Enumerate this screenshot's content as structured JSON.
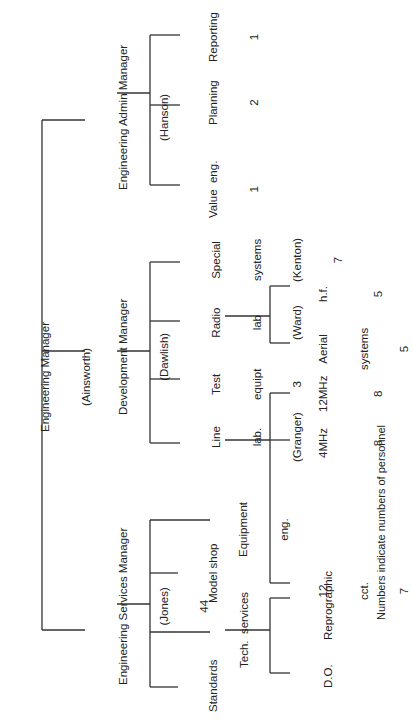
{
  "root": {
    "title": "Engineering Manager",
    "person": "(Ainsworth)"
  },
  "admin": {
    "title": "Engineering Admin Manager",
    "person": "(Hanson)",
    "children": [
      {
        "name": "Value  eng.",
        "count": "1"
      },
      {
        "name": "Planning",
        "count": "2"
      },
      {
        "name": "Reporting",
        "count": "1"
      }
    ]
  },
  "development": {
    "title": "Development Manager",
    "person": "(Dawlish)",
    "line_lab": {
      "l1": "Line",
      "l2": "lab.",
      "l3": "(Granger)",
      "children": [
        {
          "l1": "12",
          "l2": "cct.",
          "count": "7"
        },
        {
          "name": "4MHz",
          "count": "8"
        },
        {
          "name": "12MHz",
          "count": "8"
        }
      ]
    },
    "test_equipt": {
      "l1": "Test",
      "l2": "equipt",
      "count": "3"
    },
    "radio_lab": {
      "l1": "Radio",
      "l2": "lab",
      "l3": "(Ward)",
      "children": [
        {
          "l1": "Aerial",
          "l2": "systems",
          "count": "5"
        },
        {
          "name": "h.f.",
          "count": "5"
        }
      ]
    },
    "special_systems": {
      "l1": "Special",
      "l2": "systems",
      "l3": "(Kenton)",
      "count": "7"
    }
  },
  "services": {
    "title": "Engineering Services Manager",
    "person": "(Jones)",
    "count": "44",
    "standards": "Standards",
    "tech_services": {
      "name": "Tech.  services",
      "children": [
        {
          "name": "D.O."
        },
        {
          "name": "Reprographic"
        }
      ]
    },
    "model_shop": "Model shop",
    "equipment_eng": {
      "l1": "Equipment",
      "l2": "eng."
    }
  },
  "caption": "Numbers indicate numbers of personnel"
}
